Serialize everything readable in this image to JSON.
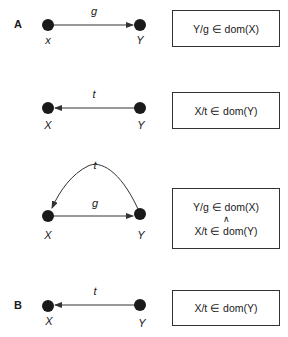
{
  "colors": {
    "node": "#1a1a1a",
    "edge": "#333333",
    "box_border": "#333333"
  },
  "sections": [
    {
      "id": "A",
      "label": "A"
    },
    {
      "id": "B",
      "label": "B"
    }
  ],
  "panels": [
    {
      "section": "A",
      "nodes": {
        "left": "x",
        "right": "Y"
      },
      "edges": [
        {
          "label": "g",
          "from": "left",
          "to": "right",
          "shape": "straight"
        }
      ],
      "box": {
        "lines": [
          "Y/g ∈ dom(X)"
        ]
      }
    },
    {
      "section": "A",
      "nodes": {
        "left": "X",
        "right": "Y"
      },
      "edges": [
        {
          "label": "t",
          "from": "right",
          "to": "left",
          "shape": "straight"
        }
      ],
      "box": {
        "lines": [
          "X/t ∈ dom(Y)"
        ]
      }
    },
    {
      "section": "A",
      "nodes": {
        "left": "X",
        "right": "Y"
      },
      "edges": [
        {
          "label": "t",
          "from": "right",
          "to": "left",
          "shape": "arc"
        },
        {
          "label": "g",
          "from": "left",
          "to": "right",
          "shape": "straight"
        }
      ],
      "box": {
        "lines": [
          "Y/g ∈ dom(X)",
          "∧",
          "X/t ∈ dom(Y)"
        ]
      }
    },
    {
      "section": "B",
      "nodes": {
        "left": "X",
        "right": "Y"
      },
      "edges": [
        {
          "label": "t",
          "from": "right",
          "to": "left",
          "shape": "straight"
        }
      ],
      "box": {
        "lines": [
          "X/t ∈ dom(Y)"
        ]
      }
    }
  ]
}
